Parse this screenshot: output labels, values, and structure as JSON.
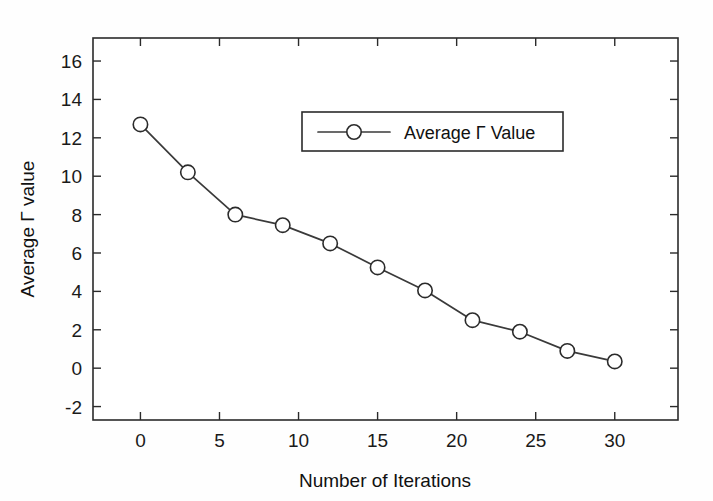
{
  "chart_data": {
    "type": "line",
    "title": "",
    "xlabel": "Number of Iterations",
    "ylabel": "Average Γ value",
    "xlim": [
      -3,
      34
    ],
    "ylim": [
      -2.7,
      17.2
    ],
    "xticks": [
      0,
      5,
      10,
      15,
      20,
      25,
      30
    ],
    "xticklabels": [
      "0",
      "5",
      "10",
      "15",
      "20",
      "25",
      "30"
    ],
    "yticks": [
      -2,
      0,
      2,
      4,
      6,
      8,
      10,
      12,
      14,
      16
    ],
    "yticklabels": [
      "-2",
      "0",
      "2",
      "4",
      "6",
      "8",
      "10",
      "12",
      "14",
      "16"
    ],
    "grid": false,
    "legend_position": "upper-center",
    "marker": "open-circle",
    "line_color": "#3a3a3a",
    "marker_face_color": "#ffffff",
    "marker_edge_color": "#2b2b2b",
    "x": [
      0,
      3,
      6,
      9,
      12,
      15,
      18,
      21,
      24,
      27,
      30
    ],
    "series": [
      {
        "name": "Average Γ Value",
        "values": [
          12.7,
          10.2,
          8.0,
          7.45,
          6.5,
          5.25,
          4.05,
          2.5,
          1.9,
          0.9,
          0.35
        ]
      }
    ]
  },
  "legend": {
    "entries": [
      {
        "label": "Average Γ Value",
        "marker": "open-circle"
      }
    ]
  },
  "axes": {
    "x_title": "Number of Iterations",
    "y_title": "Average Γ value"
  },
  "icons": {
    "marker_icon": "open-circle-marker-icon"
  }
}
